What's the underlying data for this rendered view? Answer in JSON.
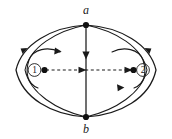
{
  "figure": {
    "type": "flow-circulation-diagram",
    "background_color": "#ffffff",
    "line_color": "#1a1a1a",
    "nodes": [
      {
        "id": "a",
        "label": "a",
        "position": "top",
        "x": 86,
        "y": 25,
        "marker": "filled-dot"
      },
      {
        "id": "b",
        "label": "b",
        "position": "bottom",
        "x": 86,
        "y": 117,
        "marker": "filled-dot"
      }
    ],
    "regions": [
      {
        "id": "region-1",
        "label": "①",
        "plain_label": "1",
        "side": "left",
        "center_dot": {
          "x": 44,
          "y": 70
        },
        "circulation": "clockwise",
        "label_position": "left-of-dot"
      },
      {
        "id": "region-2",
        "label": "②",
        "plain_label": "2",
        "side": "right",
        "center_dot": {
          "x": 134,
          "y": 70
        },
        "circulation": "counter-clockwise",
        "label_position": "right-of-dot"
      }
    ],
    "edges": [
      {
        "id": "outer-arc-left",
        "from": "b",
        "to": "a",
        "style": "solid",
        "direction": "upward",
        "arrowhead": "mid-left-up"
      },
      {
        "id": "outer-arc-right",
        "from": "a",
        "to": "b",
        "style": "solid",
        "direction": "downward",
        "arrowhead": "mid-right-down"
      },
      {
        "id": "vertical-edge",
        "from": "a",
        "to": "b",
        "style": "solid",
        "direction": "downward",
        "arrowhead": "mid-down"
      },
      {
        "id": "horizontal-axis",
        "from": "region-1",
        "to": "region-2",
        "style": "dashed",
        "direction": "rightward",
        "arrowheads": [
          "center-right",
          "end-right"
        ]
      }
    ],
    "curved_arrows": [
      {
        "id": "swirl-left",
        "around": "region-1",
        "direction": "clockwise"
      },
      {
        "id": "swirl-right",
        "around": "region-2",
        "direction": "counter-clockwise"
      }
    ]
  }
}
